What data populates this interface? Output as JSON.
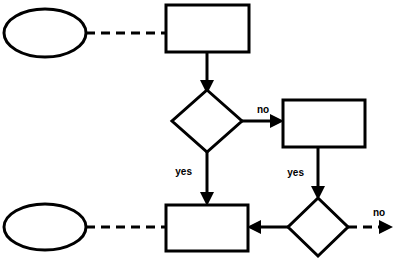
{
  "diagram": {
    "canvas": {
      "width": 397,
      "height": 261,
      "background": "#ffffff"
    },
    "stroke_color": "#000000",
    "fill_color": "#ffffff",
    "nodes": [
      {
        "id": "start-top",
        "type": "ellipse",
        "label": "",
        "cx": 45,
        "cy": 33,
        "rx": 41,
        "ry": 24
      },
      {
        "id": "process-top",
        "type": "rectangle",
        "label": "",
        "x": 166,
        "y": 5,
        "w": 83,
        "h": 47
      },
      {
        "id": "decision-top",
        "type": "diamond",
        "label": "",
        "cx": 207,
        "cy": 121,
        "rx": 35,
        "ry": 31
      },
      {
        "id": "process-right",
        "type": "rectangle",
        "label": "",
        "x": 283,
        "y": 100,
        "w": 82,
        "h": 47
      },
      {
        "id": "start-bottom",
        "type": "ellipse",
        "label": "",
        "cx": 45,
        "cy": 227,
        "rx": 41,
        "ry": 23
      },
      {
        "id": "process-bottom",
        "type": "rectangle",
        "label": "",
        "x": 166,
        "y": 205,
        "w": 82,
        "h": 46
      },
      {
        "id": "decision-bottom",
        "type": "diamond",
        "label": "",
        "cx": 318,
        "cy": 227,
        "rx": 30,
        "ry": 29
      }
    ],
    "edges": [
      {
        "id": "edge-start-top-to-process-top",
        "from": "start-top",
        "to": "process-top",
        "style": "dashed",
        "arrow": false,
        "label": ""
      },
      {
        "id": "edge-process-top-to-decision-top",
        "from": "process-top",
        "to": "decision-top",
        "style": "solid",
        "arrow": true,
        "label": ""
      },
      {
        "id": "edge-decision-top-no",
        "from": "decision-top",
        "to": "process-right",
        "style": "solid",
        "arrow": true,
        "label": "no"
      },
      {
        "id": "edge-decision-top-yes",
        "from": "decision-top",
        "to": "process-bottom",
        "style": "solid",
        "arrow": true,
        "label": "yes"
      },
      {
        "id": "edge-process-right-yes",
        "from": "process-right",
        "to": "decision-bottom",
        "style": "solid",
        "arrow": true,
        "label": "yes"
      },
      {
        "id": "edge-decision-bottom-to-process-bottom",
        "from": "decision-bottom",
        "to": "process-bottom",
        "style": "solid",
        "arrow": true,
        "label": ""
      },
      {
        "id": "edge-decision-bottom-no",
        "from": "decision-bottom",
        "to": "exit",
        "style": "dashed",
        "arrow": true,
        "label": "no"
      },
      {
        "id": "edge-start-bottom-to-process-bottom",
        "from": "start-bottom",
        "to": "process-bottom",
        "style": "dashed",
        "arrow": false,
        "label": ""
      }
    ],
    "labels": {
      "decision_top_no": "no",
      "decision_top_yes": "yes",
      "process_right_yes": "yes",
      "decision_bottom_no": "no"
    }
  }
}
